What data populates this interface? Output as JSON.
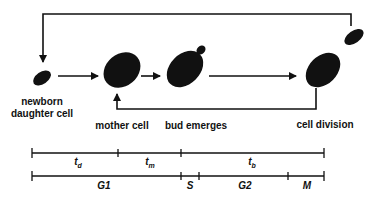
{
  "stages": {
    "newborn": "newborn",
    "newborn2": "daughter cell",
    "mother": "mother cell",
    "bud": "bud emerges",
    "division": "cell division"
  },
  "timeline_top": {
    "td": {
      "main": "t",
      "sub": "d"
    },
    "tm": {
      "main": "t",
      "sub": "m"
    },
    "tb": {
      "main": "t",
      "sub": "b"
    }
  },
  "timeline_bottom": {
    "g1": "G1",
    "s": "S",
    "g2": "G2",
    "m": "M"
  },
  "colors": {
    "ink": "#111111",
    "background": "#ffffff"
  }
}
